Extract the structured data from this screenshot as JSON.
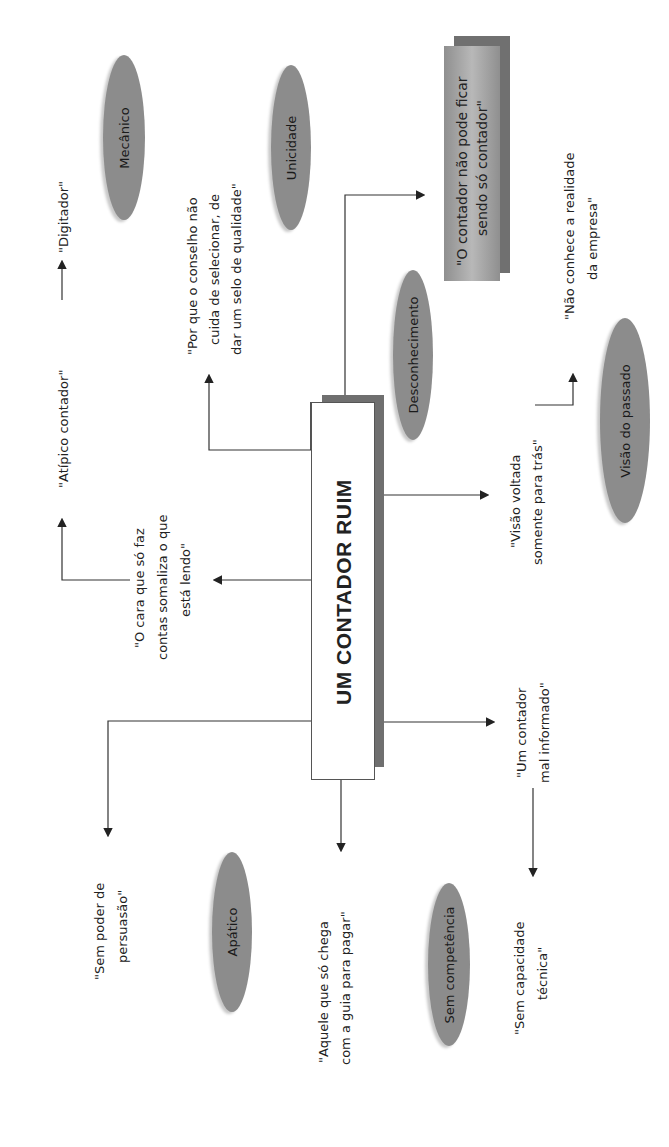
{
  "central_node": {
    "label": "UM CONTADOR RUIM"
  },
  "highlight_box": {
    "label_line1": "\"O contador não pode ficar",
    "label_line2": "sendo só contador\"",
    "color": "#9a9a9a",
    "shadow": "#7a7a7a"
  },
  "quotes": {
    "digitador": "\"Digitador\"",
    "atipico": "\"Atípico contador\"",
    "cara_contas": [
      "\"O cara que só faz",
      "contas somaliza o que",
      "está lendo\""
    ],
    "conselho": [
      "\"Por que o conselho não",
      "cuida de selecionar, de",
      "dar um selo de qualidade\""
    ],
    "nao_conhece": [
      "\"Não conhece a realidade",
      "da empresa\""
    ],
    "visao_voltada": [
      "\"Visão voltada",
      "somente para trás\""
    ],
    "mal_informado": [
      "\"Um contador",
      "mal informado\""
    ],
    "sem_poder": [
      "\"Sem poder de",
      "persuasão\""
    ],
    "aquele": [
      "\"Aquele que só chega",
      "com a guia para pagar\""
    ],
    "sem_capacidade": [
      "\"Sem capacidade",
      "técnica\""
    ]
  },
  "ellipses": {
    "mecanico": "Mecânico",
    "unicidade": "Unicidade",
    "desconhecimento": "Desconhecimento",
    "visao_passado": "Visão do passado",
    "apatico": "Apático",
    "sem_competencia": "Sem competência"
  },
  "colors": {
    "ellipse": "#8c8c8c",
    "line": "#333333",
    "box_border": "#555555",
    "box_shadow": "#777777"
  }
}
